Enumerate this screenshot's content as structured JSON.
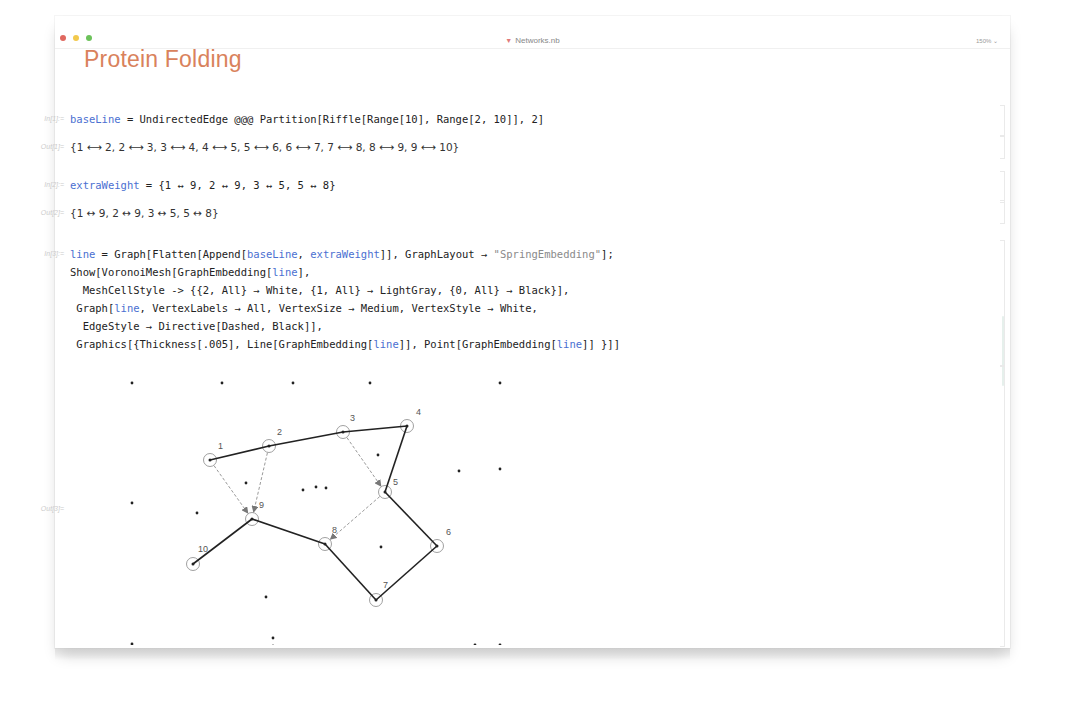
{
  "window": {
    "title": "Networks.nb",
    "zoom_level": "150%",
    "traffic_lights": {
      "close": "#e0685f",
      "minimize": "#f2c94c",
      "maximize": "#6cc25a"
    }
  },
  "notebook": {
    "title": "Protein Folding",
    "title_color": "#d9825c",
    "cells": [
      {
        "type": "input",
        "label": "In[1]:=",
        "lines": [
          [
            {
              "t": "baseLine",
              "c": "kw"
            },
            {
              "t": " = UndirectedEdge @@@ Partition[Riffle[Range[10], Range[2, 10]], 2]",
              "c": ""
            }
          ]
        ]
      },
      {
        "type": "output",
        "label": "Out[1]=",
        "text": "{1 ⟷ 2, 2 ⟷ 3, 3 ⟷ 4, 4 ⟷ 5, 5 ⟷ 6, 6 ⟷ 7, 7 ⟷ 8, 8 ⟷ 9, 9 ⟷ 10}"
      },
      {
        "type": "input",
        "label": "In[2]:=",
        "lines": [
          [
            {
              "t": "extraWeight",
              "c": "kw"
            },
            {
              "t": " = {1 ↔ 9, 2 ↔ 9, 3 ↔ 5, 5 ↔ 8}",
              "c": ""
            }
          ]
        ]
      },
      {
        "type": "output",
        "label": "Out[2]=",
        "text": "{1 ↔ 9, 2 ↔ 9, 3 ↔ 5, 5 ↔ 8}"
      },
      {
        "type": "input",
        "label": "In[3]:=",
        "lines": [
          [
            {
              "t": "line",
              "c": "kw"
            },
            {
              "t": " = Graph[Flatten[Append[",
              "c": ""
            },
            {
              "t": "baseLine",
              "c": "kw"
            },
            {
              "t": ", ",
              "c": ""
            },
            {
              "t": "extraWeight",
              "c": "kw"
            },
            {
              "t": "]], GraphLayout → ",
              "c": ""
            },
            {
              "t": "\"SpringEmbedding\"",
              "c": "str"
            },
            {
              "t": "];",
              "c": ""
            }
          ],
          [
            {
              "t": "Show[VoronoiMesh[GraphEmbedding[",
              "c": ""
            },
            {
              "t": "line",
              "c": "kw"
            },
            {
              "t": "],",
              "c": ""
            }
          ],
          [
            {
              "t": "  MeshCellStyle -> {{2, All} → White, {1, All} → LightGray, {0, All} → Black}],",
              "c": ""
            }
          ],
          [
            {
              "t": " Graph[",
              "c": ""
            },
            {
              "t": "line",
              "c": "kw"
            },
            {
              "t": ", VertexLabels → All, VertexSize → Medium, VertexStyle → White,",
              "c": ""
            }
          ],
          [
            {
              "t": "  EdgeStyle → Directive[Dashed, Black]],",
              "c": ""
            }
          ],
          [
            {
              "t": " Graphics[{Thickness[.005], Line[GraphEmbedding[",
              "c": ""
            },
            {
              "t": "line",
              "c": "kw"
            },
            {
              "t": "]], Point[GraphEmbedding[",
              "c": ""
            },
            {
              "t": "line",
              "c": "kw"
            },
            {
              "t": "]] }]]",
              "c": ""
            }
          ]
        ]
      },
      {
        "type": "graphics-output",
        "label": "Out[3]="
      }
    ]
  },
  "graph": {
    "vertices": [
      {
        "id": "1",
        "x": 140,
        "y": 95,
        "lx": 148,
        "ly": 84
      },
      {
        "id": "2",
        "x": 199,
        "y": 81,
        "lx": 207,
        "ly": 70
      },
      {
        "id": "3",
        "x": 273,
        "y": 67,
        "lx": 280,
        "ly": 56
      },
      {
        "id": "4",
        "x": 337,
        "y": 61,
        "lx": 346,
        "ly": 50
      },
      {
        "id": "5",
        "x": 315,
        "y": 127,
        "lx": 323,
        "ly": 120
      },
      {
        "id": "6",
        "x": 367,
        "y": 181,
        "lx": 376,
        "ly": 170
      },
      {
        "id": "7",
        "x": 306,
        "y": 235,
        "lx": 313,
        "ly": 223
      },
      {
        "id": "8",
        "x": 255,
        "y": 179,
        "lx": 262,
        "ly": 168
      },
      {
        "id": "9",
        "x": 182,
        "y": 154,
        "lx": 189,
        "ly": 143
      },
      {
        "id": "10",
        "x": 123,
        "y": 199,
        "lx": 128,
        "ly": 187
      }
    ],
    "solid_edges": [
      [
        "1",
        "2"
      ],
      [
        "2",
        "3"
      ],
      [
        "3",
        "4"
      ],
      [
        "4",
        "5"
      ],
      [
        "5",
        "6"
      ],
      [
        "6",
        "7"
      ],
      [
        "7",
        "8"
      ],
      [
        "8",
        "9"
      ],
      [
        "9",
        "10"
      ]
    ],
    "dashed_edges": [
      [
        "1",
        "9"
      ],
      [
        "2",
        "9"
      ],
      [
        "3",
        "5"
      ],
      [
        "5",
        "8"
      ]
    ],
    "voronoi_points": [
      [
        62,
        18
      ],
      [
        152,
        18
      ],
      [
        223,
        18
      ],
      [
        300,
        18
      ],
      [
        430,
        18
      ],
      [
        308,
        90
      ],
      [
        389,
        106
      ],
      [
        430,
        104
      ],
      [
        176,
        118
      ],
      [
        233,
        125
      ],
      [
        246,
        122
      ],
      [
        256,
        123
      ],
      [
        62,
        138
      ],
      [
        127,
        148
      ],
      [
        311,
        182
      ],
      [
        196,
        232
      ],
      [
        62,
        279
      ],
      [
        203,
        273
      ],
      [
        203,
        281
      ],
      [
        405,
        280
      ],
      [
        430,
        280
      ]
    ],
    "colors": {
      "solid": "#222222",
      "dashed": "#9a9a9a",
      "vertex_stroke": "#888888",
      "vertex_fill": "#ffffff",
      "label": "#555555",
      "point": "#222222"
    }
  }
}
